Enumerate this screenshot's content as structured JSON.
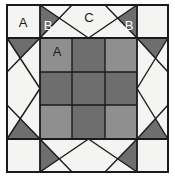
{
  "figure": {
    "name": "quilt-block-diagram",
    "canvas": {
      "width": 175,
      "height": 188
    },
    "background_color": "#ffffff"
  },
  "palette": {
    "background": "#f4f4f2",
    "light_fabric": "#f4f4f2",
    "medium_fabric": "#8f8f8f",
    "dark_fabric": "#6e6e6e",
    "outline": "#1a1a1a",
    "label_dark": "#1a1a1a",
    "label_light": "#fbfbfb"
  },
  "block": {
    "frame": {
      "x": 7,
      "y": 5,
      "width": 161,
      "height": 167,
      "border_color": "#1a1a1a",
      "border_width": 2
    },
    "grid": {
      "columns_x": [
        7,
        40,
        137,
        168
      ],
      "rows_y": [
        5,
        38,
        139,
        172
      ],
      "center_columns_x": [
        40,
        72,
        105,
        137
      ],
      "center_rows_y": [
        38,
        72,
        105,
        139
      ]
    }
  },
  "patches": [
    {
      "id": "corner-top-left",
      "shape": "square",
      "fabric": "light",
      "label": "A"
    },
    {
      "id": "corner-top-right",
      "shape": "square",
      "fabric": "light",
      "label": ""
    },
    {
      "id": "corner-bottom-left",
      "shape": "square",
      "fabric": "light",
      "label": ""
    },
    {
      "id": "corner-bottom-right",
      "shape": "square",
      "fabric": "light",
      "label": ""
    },
    {
      "id": "geese-top",
      "shape": "flying-geese",
      "fabric": "light-on-dark",
      "label": "C"
    },
    {
      "id": "geese-left",
      "shape": "flying-geese",
      "fabric": "light-on-dark",
      "label": ""
    },
    {
      "id": "geese-right",
      "shape": "flying-geese",
      "fabric": "light-on-dark",
      "label": ""
    },
    {
      "id": "geese-bottom",
      "shape": "flying-geese",
      "fabric": "light-on-dark",
      "label": ""
    },
    {
      "id": "geese-top-wing-left",
      "shape": "triangle",
      "fabric": "dark",
      "label": "B"
    },
    {
      "id": "geese-top-wing-right",
      "shape": "triangle",
      "fabric": "dark",
      "label": "B"
    },
    {
      "id": "center-r1c1",
      "shape": "square",
      "fabric": "medium",
      "label": "A"
    },
    {
      "id": "center-r1c2",
      "shape": "square",
      "fabric": "dark",
      "label": ""
    },
    {
      "id": "center-r1c3",
      "shape": "square",
      "fabric": "medium",
      "label": ""
    },
    {
      "id": "center-r2c1",
      "shape": "square",
      "fabric": "dark",
      "label": ""
    },
    {
      "id": "center-r2c2",
      "shape": "square",
      "fabric": "dark",
      "label": ""
    },
    {
      "id": "center-r2c3",
      "shape": "square",
      "fabric": "dark",
      "label": ""
    },
    {
      "id": "center-r3c1",
      "shape": "square",
      "fabric": "medium",
      "label": ""
    },
    {
      "id": "center-r3c2",
      "shape": "square",
      "fabric": "dark",
      "label": ""
    },
    {
      "id": "center-r3c3",
      "shape": "square",
      "fabric": "medium",
      "label": ""
    }
  ],
  "labels": {
    "corner_a": {
      "text": "A",
      "x": 23,
      "y": 24,
      "tone": "dark"
    },
    "wing_b_left": {
      "text": "B",
      "x": 48,
      "y": 27,
      "tone": "light"
    },
    "geese_c": {
      "text": "C",
      "x": 89,
      "y": 19,
      "tone": "dark"
    },
    "wing_b_right": {
      "text": "B",
      "x": 129,
      "y": 27,
      "tone": "light"
    },
    "center_a": {
      "text": "A",
      "x": 57,
      "y": 53,
      "tone": "dark"
    }
  }
}
